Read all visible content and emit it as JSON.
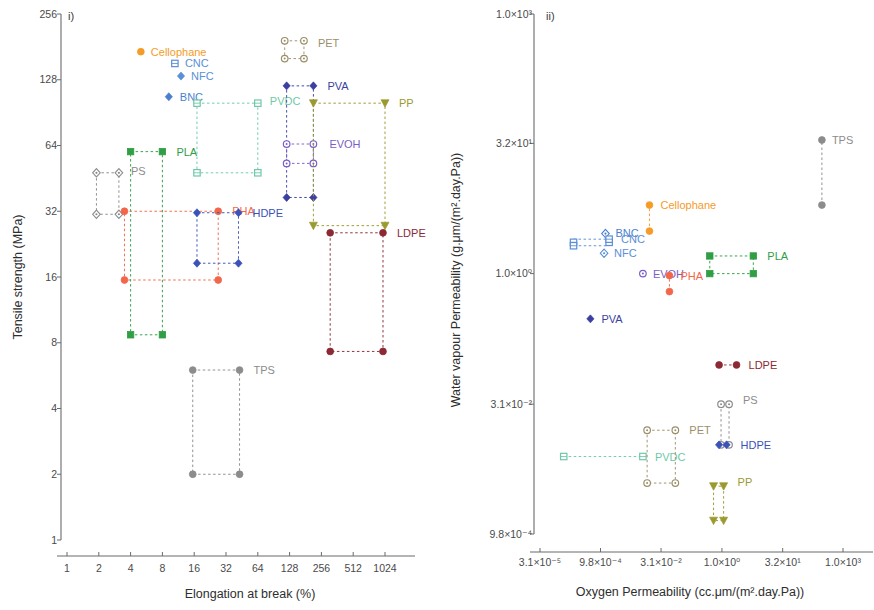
{
  "figure": {
    "width": 874,
    "height": 610,
    "background": "#ffffff"
  },
  "colors": {
    "cellophane": "#f59b28",
    "cnc": "#5b8fd6",
    "nfc": "#5b8fd6",
    "bnc": "#4a7fd0",
    "pet": "#9b8f6a",
    "pva": "#3b3fa0",
    "pvdc": "#6fc9a8",
    "evoh": "#7b5ec7",
    "pp": "#9a9a30",
    "ps": "#8c8c8c",
    "pha": "#f2674a",
    "hdpe": "#3b52b8",
    "pla": "#2f9e44",
    "ldpe": "#8b2a34",
    "tps": "#8c8c8c"
  },
  "chart_data": [
    {
      "id": "panel-i",
      "type": "scatter",
      "panel_label": "i)",
      "title": "",
      "xlabel": "Elongation at break (%)",
      "ylabel": "Tensile strength (MPa)",
      "xscale": "log2",
      "yscale": "log2",
      "xlim": [
        1,
        2048
      ],
      "ylim": [
        1,
        256
      ],
      "xticks": [
        1,
        2,
        4,
        8,
        16,
        32,
        64,
        128,
        256,
        512,
        1024
      ],
      "xticklabels": [
        "1",
        "2",
        "4",
        "8",
        "16",
        "32",
        "64",
        "128",
        "256",
        "512",
        "1024"
      ],
      "yticks": [
        1,
        2,
        4,
        8,
        16,
        32,
        64,
        128,
        256
      ],
      "yticklabels": [
        "1",
        "2",
        "4",
        "8",
        "16",
        "32",
        "64",
        "128",
        "256"
      ],
      "grid": false,
      "legend": "inline-labels",
      "series": [
        {
          "name": "Cellophane",
          "marker": "circle-filled",
          "color": "cellophane",
          "points": [
            {
              "x": 5.0,
              "y": 172.0
            }
          ],
          "label_pos": {
            "dx": 10,
            "dy": 4
          }
        },
        {
          "name": "CNC",
          "marker": "square-hollow",
          "color": "cnc",
          "points": [
            {
              "x": 10.5,
              "y": 152.0
            }
          ],
          "label_pos": {
            "dx": 10,
            "dy": 4
          }
        },
        {
          "name": "NFC",
          "marker": "diamond-filled",
          "color": "nfc",
          "points": [
            {
              "x": 12.0,
              "y": 133.0
            }
          ],
          "label_pos": {
            "dx": 10,
            "dy": 4
          }
        },
        {
          "name": "BNC",
          "marker": "diamond-filled",
          "color": "bnc",
          "points": [
            {
              "x": 9.2,
              "y": 107.0
            }
          ],
          "label_pos": {
            "dx": 11,
            "dy": 4
          }
        },
        {
          "name": "PET",
          "marker": "circle-hollow",
          "color": "pet",
          "box": {
            "x1": 115.0,
            "x2": 175.0,
            "y1": 160.0,
            "y2": 193.0
          },
          "points": [
            {
              "x": 115.0,
              "y": 193.0
            },
            {
              "x": 175.0,
              "y": 193.0
            },
            {
              "x": 115.0,
              "y": 160.0
            },
            {
              "x": 175.0,
              "y": 160.0
            }
          ],
          "label_pos": {
            "dx": 14,
            "dy": 6
          }
        },
        {
          "name": "PVDC",
          "marker": "square-hollow",
          "color": "pvdc",
          "box": {
            "x1": 17.0,
            "x2": 64.0,
            "y1": 48.0,
            "y2": 100.0
          },
          "points": [
            {
              "x": 17.0,
              "y": 100.0
            },
            {
              "x": 64.0,
              "y": 100.0
            },
            {
              "x": 17.0,
              "y": 48.0
            },
            {
              "x": 64.0,
              "y": 48.0
            }
          ],
          "label_pos": {
            "dx": 12,
            "dy": 2
          }
        },
        {
          "name": "PVA",
          "marker": "diamond-filled",
          "color": "pva",
          "box": {
            "x1": 120.0,
            "x2": 215.0,
            "y1": 37.0,
            "y2": 120.0
          },
          "points": [
            {
              "x": 120.0,
              "y": 120.0
            },
            {
              "x": 215.0,
              "y": 120.0
            },
            {
              "x": 120.0,
              "y": 37.0
            },
            {
              "x": 215.0,
              "y": 37.0
            }
          ],
          "label_pos": {
            "dx": 14,
            "dy": 4
          }
        },
        {
          "name": "EVOH",
          "marker": "circle-hollow",
          "color": "evoh",
          "box": {
            "x1": 120.0,
            "x2": 215.0,
            "y1": 53.0,
            "y2": 65.0
          },
          "points": [
            {
              "x": 120.0,
              "y": 65.0
            },
            {
              "x": 215.0,
              "y": 65.0
            },
            {
              "x": 120.0,
              "y": 53.0
            },
            {
              "x": 215.0,
              "y": 53.0
            }
          ],
          "label_pos": {
            "dx": 16,
            "dy": 4
          }
        },
        {
          "name": "PP",
          "marker": "triangle-down",
          "color": "pp",
          "box": {
            "x1": 215.0,
            "x2": 1024.0,
            "y1": 27.5,
            "y2": 100.0
          },
          "points": [
            {
              "x": 215.0,
              "y": 100.0
            },
            {
              "x": 1024.0,
              "y": 100.0
            },
            {
              "x": 215.0,
              "y": 27.5
            },
            {
              "x": 1024.0,
              "y": 27.5
            }
          ],
          "label_pos": {
            "dx": 14,
            "dy": 4
          }
        },
        {
          "name": "PS",
          "marker": "diamond-hollow",
          "color": "ps",
          "box": {
            "x1": 1.9,
            "x2": 3.1,
            "y1": 31.0,
            "y2": 48.0
          },
          "points": [
            {
              "x": 1.9,
              "y": 48.0
            },
            {
              "x": 3.1,
              "y": 48.0
            },
            {
              "x": 1.9,
              "y": 31.0
            },
            {
              "x": 3.1,
              "y": 31.0
            }
          ],
          "label_pos": {
            "dx": 12,
            "dy": 2
          }
        },
        {
          "name": "PHA",
          "marker": "circle-filled",
          "color": "pha",
          "box": {
            "x1": 3.5,
            "x2": 27.0,
            "y1": 15.5,
            "y2": 32.0
          },
          "points": [
            {
              "x": 3.5,
              "y": 32.0
            },
            {
              "x": 27.0,
              "y": 32.0
            },
            {
              "x": 3.5,
              "y": 15.5
            },
            {
              "x": 27.0,
              "y": 15.5
            }
          ],
          "label_pos": {
            "dx": 14,
            "dy": 4
          }
        },
        {
          "name": "HDPE",
          "marker": "diamond-filled",
          "color": "hdpe",
          "box": {
            "x1": 17.0,
            "x2": 42.0,
            "y1": 18.5,
            "y2": 31.5
          },
          "points": [
            {
              "x": 17.0,
              "y": 31.5
            },
            {
              "x": 42.0,
              "y": 31.5
            },
            {
              "x": 17.0,
              "y": 18.5
            },
            {
              "x": 42.0,
              "y": 18.5
            }
          ],
          "label_pos": {
            "dx": 14,
            "dy": 4
          }
        },
        {
          "name": "PLA",
          "marker": "square-filled",
          "color": "pla",
          "box": {
            "x1": 4.0,
            "x2": 8.0,
            "y1": 8.7,
            "y2": 60.0
          },
          "points": [
            {
              "x": 4.0,
              "y": 60.0
            },
            {
              "x": 8.0,
              "y": 60.0
            },
            {
              "x": 4.0,
              "y": 8.7
            },
            {
              "x": 8.0,
              "y": 8.7
            }
          ],
          "label_pos": {
            "dx": 14,
            "dy": 4
          }
        },
        {
          "name": "LDPE",
          "marker": "circle-filled",
          "color": "ldpe",
          "box": {
            "x1": 310.0,
            "x2": 980.0,
            "y1": 7.3,
            "y2": 25.5
          },
          "points": [
            {
              "x": 310.0,
              "y": 25.5
            },
            {
              "x": 980.0,
              "y": 25.5
            },
            {
              "x": 310.0,
              "y": 7.3
            },
            {
              "x": 980.0,
              "y": 7.3
            }
          ],
          "label_pos": {
            "dx": 14,
            "dy": 4
          }
        },
        {
          "name": "TPS",
          "marker": "circle-filled",
          "color": "tps",
          "box": {
            "x1": 15.5,
            "x2": 43.0,
            "y1": 2.0,
            "y2": 6.0
          },
          "points": [
            {
              "x": 15.5,
              "y": 6.0
            },
            {
              "x": 43.0,
              "y": 6.0
            },
            {
              "x": 15.5,
              "y": 2.0
            },
            {
              "x": 43.0,
              "y": 2.0
            }
          ],
          "label_pos": {
            "dx": 14,
            "dy": 4
          }
        }
      ]
    },
    {
      "id": "panel-ii",
      "type": "scatter",
      "panel_label": "ii)",
      "title": "",
      "xlabel": "Oxygen Permeability (cc.μm/(m².day.Pa))",
      "ylabel": "Water vapour Permeability (g.μm/(m².day.Pa))",
      "xscale": "log10",
      "yscale": "log10",
      "xlim": [
        3.1e-05,
        10000.0
      ],
      "ylim": [
        0.00098,
        1000.0
      ],
      "xticks": [
        3.1e-05,
        0.00098,
        0.031,
        1.0,
        32.0,
        1000.0
      ],
      "xticklabels": [
        "3.1×10⁻⁵",
        "9.8×10⁻⁴",
        "3.1×10⁻²",
        "1.0×10⁰",
        "3.2×10¹",
        "1.0×10³"
      ],
      "yticks": [
        0.00098,
        0.031,
        1.0,
        32.0,
        1000.0
      ],
      "yticklabels": [
        "9.8×10⁻⁴",
        "3.1×10⁻²",
        "1.0×10⁰",
        "3.2×10¹",
        "1.0×10³"
      ],
      "grid": false,
      "legend": "inline-labels",
      "series": [
        {
          "name": "TPS",
          "marker": "circle-filled",
          "color": "tps",
          "box": {
            "x1": 300.0,
            "x2": 300.0,
            "y1": 6.2,
            "y2": 35.0
          },
          "points": [
            {
              "x": 300.0,
              "y": 35.0
            },
            {
              "x": 300.0,
              "y": 6.2
            }
          ],
          "label_pos": {
            "dx": 10,
            "dy": 4
          }
        },
        {
          "name": "Cellophane",
          "marker": "circle-filled",
          "color": "cellophane",
          "box": {
            "x1": 0.016,
            "x2": 0.016,
            "y1": 3.1,
            "y2": 6.2
          },
          "points": [
            {
              "x": 0.016,
              "y": 6.2
            },
            {
              "x": 0.016,
              "y": 3.1
            }
          ],
          "label_pos": {
            "dx": 11,
            "dy": 4
          }
        },
        {
          "name": "BNC",
          "marker": "diamond-hollow",
          "color": "bnc",
          "points": [
            {
              "x": 0.0013,
              "y": 2.9
            }
          ],
          "label_pos": {
            "dx": 10,
            "dy": 3
          }
        },
        {
          "name": "CNC",
          "marker": "square-hollow",
          "color": "cnc",
          "box": {
            "x1": 0.00021,
            "x2": 0.0016,
            "y1": 2.1,
            "y2": 2.5
          },
          "points": [
            {
              "x": 0.00021,
              "y": 2.3
            },
            {
              "x": 0.0016,
              "y": 2.3
            },
            {
              "x": 0.00021,
              "y": 2.1
            },
            {
              "x": 0.0016,
              "y": 2.5
            }
          ],
          "label_pos": {
            "dx": 12,
            "dy": 4
          }
        },
        {
          "name": "NFC",
          "marker": "diamond-hollow",
          "color": "nfc",
          "points": [
            {
              "x": 0.0012,
              "y": 1.72
            }
          ],
          "label_pos": {
            "dx": 10,
            "dy": 4
          }
        },
        {
          "name": "PLA",
          "marker": "square-filled",
          "color": "pla",
          "box": {
            "x1": 0.5,
            "x2": 6.0,
            "y1": 1.0,
            "y2": 1.6
          },
          "points": [
            {
              "x": 0.5,
              "y": 1.6
            },
            {
              "x": 6.0,
              "y": 1.6
            },
            {
              "x": 0.5,
              "y": 1.0
            },
            {
              "x": 6.0,
              "y": 1.0
            }
          ],
          "label_pos": {
            "dx": 14,
            "dy": 4
          }
        },
        {
          "name": "EVOH",
          "marker": "circle-hollow",
          "color": "evoh",
          "points": [
            {
              "x": 0.011,
              "y": 1.0
            }
          ],
          "label_pos": {
            "dx": 10,
            "dy": 4
          }
        },
        {
          "name": "PHA",
          "marker": "circle-filled",
          "color": "pha",
          "box": {
            "x1": 0.05,
            "x2": 0.05,
            "y1": 0.62,
            "y2": 0.95
          },
          "points": [
            {
              "x": 0.05,
              "y": 0.95
            },
            {
              "x": 0.05,
              "y": 0.62
            }
          ],
          "label_pos": {
            "dx": 11,
            "dy": 4
          }
        },
        {
          "name": "PVA",
          "marker": "diamond-filled",
          "color": "pva",
          "points": [
            {
              "x": 0.00055,
              "y": 0.3
            }
          ],
          "label_pos": {
            "dx": 11,
            "dy": 4
          }
        },
        {
          "name": "LDPE",
          "marker": "circle-filled",
          "color": "ldpe",
          "box": {
            "x1": 0.85,
            "x2": 2.3,
            "y1": 0.088,
            "y2": 0.088
          },
          "points": [
            {
              "x": 0.85,
              "y": 0.088
            },
            {
              "x": 2.3,
              "y": 0.088
            }
          ],
          "label_pos": {
            "dx": 12,
            "dy": 4
          }
        },
        {
          "name": "PS",
          "marker": "circle-hollow",
          "color": "ps",
          "box": {
            "x1": 0.95,
            "x2": 1.5,
            "y1": 0.0105,
            "y2": 0.031
          },
          "points": [
            {
              "x": 0.95,
              "y": 0.031
            },
            {
              "x": 1.5,
              "y": 0.031
            },
            {
              "x": 0.95,
              "y": 0.0105
            },
            {
              "x": 1.5,
              "y": 0.0105
            }
          ],
          "label_pos": {
            "dx": 14,
            "dy": 0
          }
        },
        {
          "name": "PVDC",
          "marker": "square-hollow",
          "color": "pvdc",
          "box": {
            "x1": 0.00012,
            "x2": 0.011,
            "y1": 0.0077,
            "y2": 0.0077
          },
          "points": [
            {
              "x": 0.00012,
              "y": 0.0077
            },
            {
              "x": 0.011,
              "y": 0.0077
            }
          ],
          "label_pos": {
            "dx": 12,
            "dy": 4
          }
        },
        {
          "name": "HDPE",
          "marker": "diamond-filled",
          "color": "hdpe",
          "box": {
            "x1": 0.85,
            "x2": 1.3,
            "y1": 0.0105,
            "y2": 0.0105
          },
          "points": [
            {
              "x": 0.85,
              "y": 0.0105
            },
            {
              "x": 1.3,
              "y": 0.0105
            }
          ],
          "label_pos": {
            "dx": 14,
            "dy": 4
          }
        },
        {
          "name": "PET",
          "marker": "circle-hollow",
          "color": "pet",
          "box": {
            "x1": 0.014,
            "x2": 0.07,
            "y1": 0.0038,
            "y2": 0.0155
          },
          "points": [
            {
              "x": 0.014,
              "y": 0.0155
            },
            {
              "x": 0.07,
              "y": 0.0155
            },
            {
              "x": 0.014,
              "y": 0.0038
            },
            {
              "x": 0.07,
              "y": 0.0038
            }
          ],
          "label_pos": {
            "dx": 14,
            "dy": 4
          }
        },
        {
          "name": "PP",
          "marker": "triangle-down",
          "color": "pp",
          "box": {
            "x1": 0.62,
            "x2": 1.1,
            "y1": 0.0014,
            "y2": 0.0035
          },
          "points": [
            {
              "x": 0.62,
              "y": 0.0035
            },
            {
              "x": 1.1,
              "y": 0.0035
            },
            {
              "x": 0.62,
              "y": 0.0014
            },
            {
              "x": 1.1,
              "y": 0.0014
            }
          ],
          "label_pos": {
            "dx": 14,
            "dy": 0
          }
        }
      ]
    }
  ]
}
